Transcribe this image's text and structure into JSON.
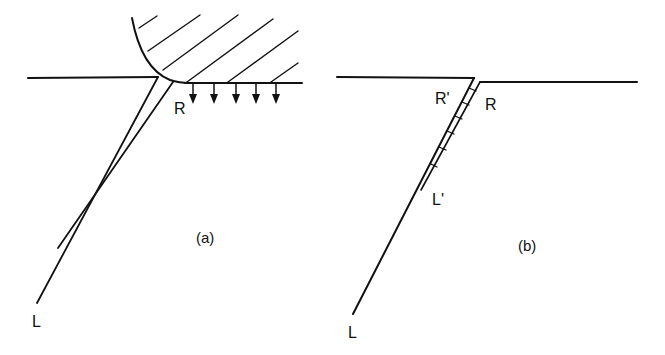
{
  "figure": {
    "panel_a": {
      "caption": "(a)",
      "labels": {
        "tip": "R",
        "root": "L"
      }
    },
    "panel_b": {
      "caption": "(b)",
      "labels": {
        "tip_right": "R",
        "tip_left": "R'",
        "mid": "L'",
        "root": "L"
      }
    },
    "colors": {
      "line": "#111111",
      "background": "#ffffff"
    }
  }
}
